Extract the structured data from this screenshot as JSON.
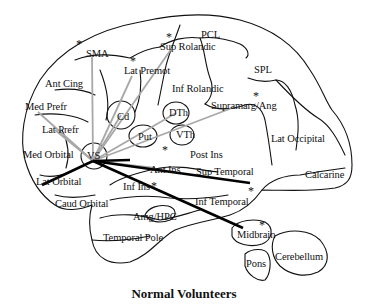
{
  "figure": {
    "caption": "Normal Volunteers",
    "colors": {
      "outline": "#111111",
      "thick_connection": "#000000",
      "thin_connection": "#a8a8a8",
      "background": "#ffffff"
    },
    "hub": {
      "label": "VS",
      "x": 93,
      "y": 161
    },
    "regions": [
      {
        "id": "sma",
        "label": "SMA",
        "x": 86,
        "y": 49,
        "asterisk": true
      },
      {
        "id": "sup-rolandic",
        "label": "Sup Rolandic",
        "x": 160,
        "y": 42,
        "asterisk": true
      },
      {
        "id": "pcl",
        "label": "PCL",
        "x": 201,
        "y": 30,
        "asterisk": false
      },
      {
        "id": "lat-premot",
        "label": "Lat Premot",
        "x": 124,
        "y": 66,
        "asterisk": true
      },
      {
        "id": "ant-cing",
        "label": "Ant Cing",
        "x": 45,
        "y": 79,
        "asterisk": false
      },
      {
        "id": "spl",
        "label": "SPL",
        "x": 254,
        "y": 65,
        "asterisk": false
      },
      {
        "id": "inf-rolandic",
        "label": "Inf Rolandic",
        "x": 172,
        "y": 84,
        "asterisk": false
      },
      {
        "id": "med-prefr",
        "label": "Med Prefr",
        "x": 25,
        "y": 102,
        "asterisk": false
      },
      {
        "id": "cd",
        "label": "Cd",
        "x": 117,
        "y": 112,
        "asterisk": false
      },
      {
        "id": "dth",
        "label": "DTh",
        "x": 169,
        "y": 108,
        "asterisk": false
      },
      {
        "id": "supramarg-ang",
        "label": "Supramarg/Ang",
        "x": 211,
        "y": 101,
        "asterisk": true
      },
      {
        "id": "lat-prefr",
        "label": "Lat Prefr",
        "x": 42,
        "y": 125,
        "asterisk": false
      },
      {
        "id": "put",
        "label": "Put",
        "x": 138,
        "y": 132,
        "asterisk": true
      },
      {
        "id": "vth",
        "label": "VTh",
        "x": 176,
        "y": 130,
        "asterisk": false
      },
      {
        "id": "lat-occipital",
        "label": "Lat Occipital",
        "x": 271,
        "y": 134,
        "asterisk": false
      },
      {
        "id": "med-orbital",
        "label": "Med Orbital",
        "x": 23,
        "y": 150,
        "asterisk": false
      },
      {
        "id": "vs",
        "label": "VS",
        "x": 87,
        "y": 151,
        "asterisk": false
      },
      {
        "id": "post-ins",
        "label": "Post Ins",
        "x": 190,
        "y": 150,
        "asterisk": false
      },
      {
        "id": "lat-orbital",
        "label": "Lat Orbital",
        "x": 36,
        "y": 177,
        "asterisk": false
      },
      {
        "id": "ant-ins",
        "label": "Ant Ins",
        "x": 150,
        "y": 165,
        "asterisk": false
      },
      {
        "id": "sup-temporal",
        "label": "Sup Temporal",
        "x": 196,
        "y": 167,
        "asterisk": true
      },
      {
        "id": "calcarine",
        "label": "Calcarine",
        "x": 305,
        "y": 170,
        "asterisk": false
      },
      {
        "id": "inf-ins",
        "label": "Inf Ins",
        "x": 123,
        "y": 182,
        "asterisk": true
      },
      {
        "id": "caud-orbital",
        "label": "Caud Orbital",
        "x": 55,
        "y": 199,
        "asterisk": false
      },
      {
        "id": "inf-temporal",
        "label": "Inf Temporal",
        "x": 195,
        "y": 197,
        "asterisk": false
      },
      {
        "id": "amg-hpc",
        "label": "Amg/HPC",
        "x": 133,
        "y": 212,
        "asterisk": false
      },
      {
        "id": "midbrain",
        "label": "Midbrain",
        "x": 237,
        "y": 230,
        "asterisk": true
      },
      {
        "id": "temporal-pole",
        "label": "Temporal Pole",
        "x": 103,
        "y": 233,
        "asterisk": false
      },
      {
        "id": "cerebellum",
        "label": "Cerebellum",
        "x": 275,
        "y": 252,
        "asterisk": false
      },
      {
        "id": "pons",
        "label": "Pons",
        "x": 246,
        "y": 259,
        "asterisk": false
      }
    ],
    "connections": [
      {
        "to": "Lat Orbital",
        "weight": "thick"
      },
      {
        "to": "Sup Temporal",
        "weight": "thick"
      },
      {
        "to": "Midbrain",
        "weight": "thick"
      },
      {
        "to": "Put",
        "weight": "thick"
      },
      {
        "to": "SMA",
        "weight": "thin"
      },
      {
        "to": "Lat Premot",
        "weight": "thin"
      },
      {
        "to": "Sup Rolandic",
        "weight": "thin"
      },
      {
        "to": "Med Prefr",
        "weight": "thin"
      },
      {
        "to": "Lat Prefr",
        "weight": "thin"
      },
      {
        "to": "Cd",
        "weight": "thin"
      },
      {
        "to": "DTh",
        "weight": "thin"
      },
      {
        "to": "Supramarg/Ang",
        "weight": "thin"
      },
      {
        "to": "Ant Ins",
        "weight": "thin"
      }
    ]
  }
}
